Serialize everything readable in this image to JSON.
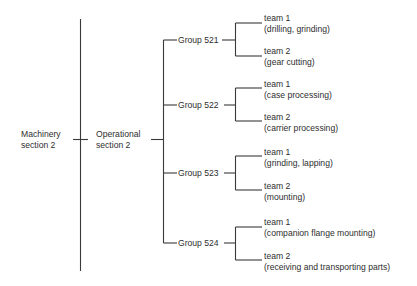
{
  "diagram": {
    "type": "org-tree",
    "root": {
      "label_line1": "Machinery",
      "label_line2": "section 2"
    },
    "section": {
      "label_line1": "Operational",
      "label_line2": "section 2"
    },
    "groups": [
      {
        "label": "Group 521",
        "teams": [
          {
            "name": "team 1",
            "task": "(drilling, grinding)"
          },
          {
            "name": "team 2",
            "task": "(gear cutting)"
          }
        ]
      },
      {
        "label": "Group 522",
        "teams": [
          {
            "name": "team 1",
            "task": "(case processing)"
          },
          {
            "name": "team 2",
            "task": "(carrier processing)"
          }
        ]
      },
      {
        "label": "Group 523",
        "teams": [
          {
            "name": "team 1",
            "task": "(grinding, lapping)"
          },
          {
            "name": "team 2",
            "task": "(mounting)"
          }
        ]
      },
      {
        "label": "Group 524",
        "teams": [
          {
            "name": "team 1",
            "task": "(companion flange mounting)"
          },
          {
            "name": "team 2",
            "task": "(receiving and transporting parts)"
          }
        ]
      }
    ],
    "colors": {
      "line": "#3a3a3a",
      "text": "#2e2e2e",
      "background": "#ffffff"
    }
  }
}
